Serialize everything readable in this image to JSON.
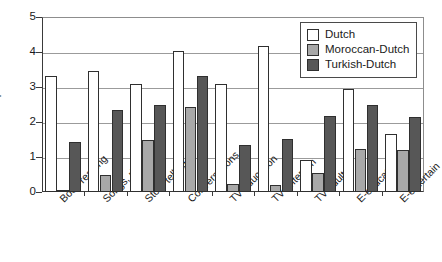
{
  "chart_data": {
    "type": "bar",
    "title": "",
    "xlabel": "",
    "ylabel": "Input",
    "ylim": [
      0,
      5
    ],
    "yticks": [
      0,
      1,
      2,
      3,
      4,
      5
    ],
    "grid": true,
    "legend_position": "top-right",
    "categories": [
      "Book reading",
      "Songs, rhymes",
      "Story telling",
      "Conversations",
      "TV-education",
      "TV-entertain",
      "TV-adults",
      "E-education",
      "E-entertain"
    ],
    "series": [
      {
        "name": "Dutch",
        "color": "#ffffff",
        "values": [
          3.31,
          3.46,
          3.09,
          4.03,
          3.1,
          4.17,
          0.92,
          2.93,
          1.65
        ]
      },
      {
        "name": "Moroccan-Dutch",
        "color": "#a8a8a8",
        "values": [
          0.05,
          0.5,
          1.5,
          2.44,
          0.22,
          0.2,
          0.55,
          1.24,
          1.2
        ]
      },
      {
        "name": "Turkish-Dutch",
        "color": "#575757",
        "values": [
          1.43,
          2.33,
          2.5,
          3.31,
          1.35,
          1.52,
          2.17,
          2.5,
          2.13
        ]
      }
    ]
  },
  "axis": {
    "y_title": "Input",
    "y_tick_labels": [
      "0",
      "1",
      "2",
      "3",
      "4",
      "5"
    ]
  },
  "legend": {
    "items": [
      {
        "label": "Dutch",
        "color": "#ffffff"
      },
      {
        "label": "Moroccan-Dutch",
        "color": "#a8a8a8"
      },
      {
        "label": "Turkish-Dutch",
        "color": "#575757"
      }
    ]
  }
}
